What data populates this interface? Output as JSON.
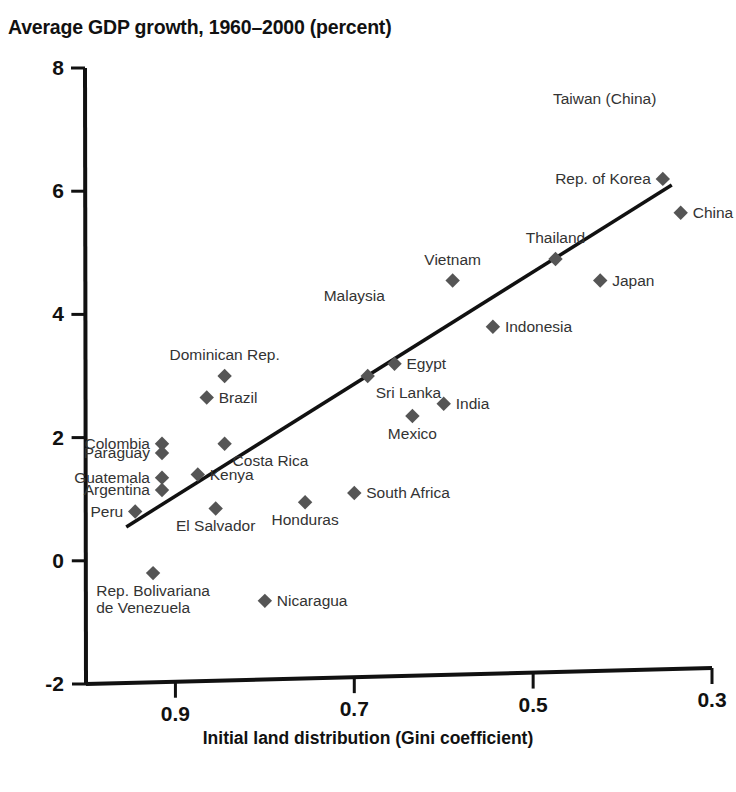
{
  "chart_data": {
    "type": "scatter",
    "title": "Average GDP growth, 1960–2000 (percent)",
    "xlabel": "Initial land distribution (Gini coefficient)",
    "ylabel": "",
    "xlim": [
      1.0,
      0.3
    ],
    "ylim": [
      -2,
      8
    ],
    "x_ticks": [
      "0.9",
      "0.7",
      "0.5",
      "0.3"
    ],
    "x_tick_values": [
      0.9,
      0.7,
      0.5,
      0.3
    ],
    "y_ticks": [
      "8",
      "6",
      "4",
      "2",
      "0",
      "-2"
    ],
    "y_tick_values": [
      8,
      6,
      4,
      2,
      0,
      -2
    ],
    "x_axis_reversed": true,
    "grid": false,
    "legend": null,
    "marker_shape": "diamond",
    "marker_color": "#555555",
    "axis_color": "#111111",
    "trendline": {
      "label": "fitted regression line",
      "color": "#111111",
      "x_start": 0.955,
      "y_start": 0.55,
      "x_end": 0.345,
      "y_end": 6.1
    },
    "points": [
      {
        "name": "Taiwan (China)",
        "x": 0.42,
        "y": 7.35,
        "label_pos": "none",
        "marker": false
      },
      {
        "name": "Rep. of Korea",
        "x": 0.355,
        "y": 6.2,
        "label_pos": "left",
        "marker": true
      },
      {
        "name": "China",
        "x": 0.335,
        "y": 5.65,
        "label_pos": "right",
        "marker": true
      },
      {
        "name": "Thailand",
        "x": 0.475,
        "y": 4.9,
        "label_pos": "above",
        "marker": true
      },
      {
        "name": "Japan",
        "x": 0.425,
        "y": 4.55,
        "label_pos": "right",
        "marker": true
      },
      {
        "name": "Vietnam",
        "x": 0.59,
        "y": 4.55,
        "label_pos": "above",
        "marker": true
      },
      {
        "name": "Malaysia",
        "x": 0.7,
        "y": 4.15,
        "label_pos": "none",
        "marker": false
      },
      {
        "name": "Indonesia",
        "x": 0.545,
        "y": 3.8,
        "label_pos": "right",
        "marker": true
      },
      {
        "name": "Egypt",
        "x": 0.655,
        "y": 3.2,
        "label_pos": "right",
        "marker": true
      },
      {
        "name": "Sri Lanka",
        "x": 0.685,
        "y": 3.0,
        "label_pos": "belowright",
        "marker": true
      },
      {
        "name": "Dominican Rep.",
        "x": 0.845,
        "y": 3.0,
        "label_pos": "above",
        "marker": true
      },
      {
        "name": "Brazil",
        "x": 0.865,
        "y": 2.65,
        "label_pos": "right",
        "marker": true
      },
      {
        "name": "India",
        "x": 0.6,
        "y": 2.55,
        "label_pos": "right",
        "marker": true
      },
      {
        "name": "Mexico",
        "x": 0.635,
        "y": 2.35,
        "label_pos": "below",
        "marker": true
      },
      {
        "name": "Costa Rica",
        "x": 0.845,
        "y": 1.9,
        "label_pos": "belowright",
        "marker": true
      },
      {
        "name": "Colombia",
        "x": 0.915,
        "y": 1.9,
        "label_pos": "left",
        "marker": true
      },
      {
        "name": "Paraguay",
        "x": 0.915,
        "y": 1.75,
        "label_pos": "left",
        "marker": true
      },
      {
        "name": "Kenya",
        "x": 0.875,
        "y": 1.4,
        "label_pos": "right",
        "marker": true
      },
      {
        "name": "Guatemala",
        "x": 0.915,
        "y": 1.35,
        "label_pos": "left",
        "marker": true
      },
      {
        "name": "Argentina",
        "x": 0.915,
        "y": 1.15,
        "label_pos": "left",
        "marker": true
      },
      {
        "name": "South Africa",
        "x": 0.7,
        "y": 1.1,
        "label_pos": "right",
        "marker": true
      },
      {
        "name": "Honduras",
        "x": 0.755,
        "y": 0.95,
        "label_pos": "below",
        "marker": true
      },
      {
        "name": "El Salvador",
        "x": 0.855,
        "y": 0.85,
        "label_pos": "below",
        "marker": true
      },
      {
        "name": "Peru",
        "x": 0.945,
        "y": 0.8,
        "label_pos": "left",
        "marker": true
      },
      {
        "name": "Rep. Bolivariana\nde Venezuela",
        "x": 0.925,
        "y": -0.2,
        "label_pos": "below",
        "marker": true
      },
      {
        "name": "Nicaragua",
        "x": 0.8,
        "y": -0.65,
        "label_pos": "right",
        "marker": true
      }
    ]
  },
  "caption": ""
}
